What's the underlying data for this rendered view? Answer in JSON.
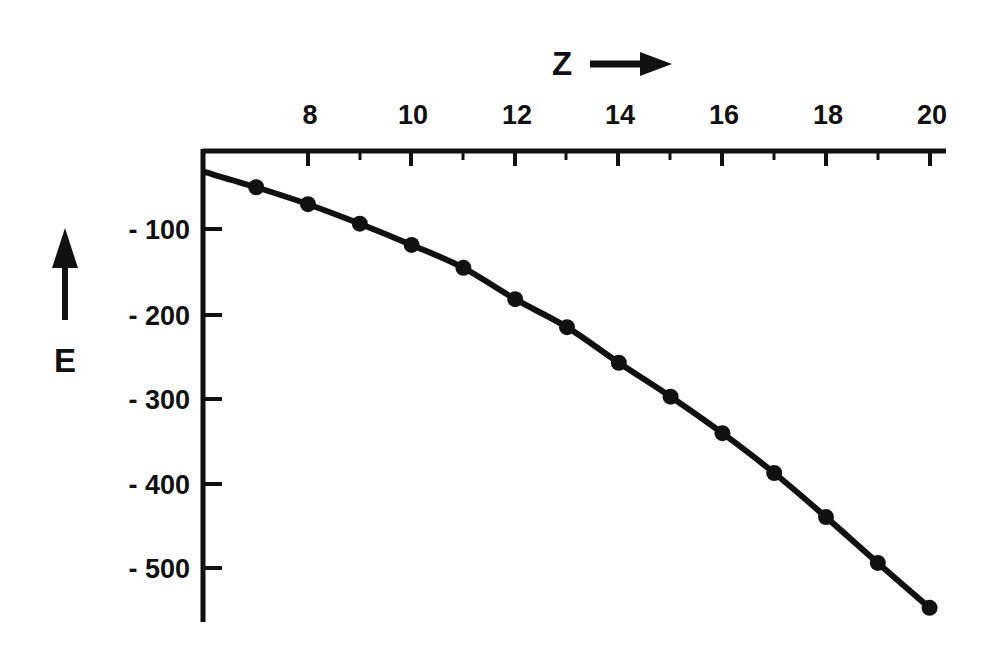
{
  "figure": {
    "background_color": "#ffffff",
    "ink_color": "#111111"
  },
  "axes": {
    "x": {
      "title": "Z",
      "title_arrow": "⟶",
      "position": "top",
      "tick_labels": [
        "8",
        "10",
        "12",
        "14",
        "16",
        "18",
        "20"
      ],
      "tick_values": [
        8,
        10,
        12,
        14,
        16,
        18,
        20
      ],
      "range": [
        6,
        20.5
      ],
      "minor_ticks": true
    },
    "y": {
      "title": "E",
      "title_arrow": "↑",
      "position": "left",
      "tick_labels": [
        "- 100",
        "- 200",
        "- 300",
        "- 400",
        "- 500"
      ],
      "tick_values": [
        -100,
        -200,
        -300,
        -400,
        -500
      ],
      "range": [
        -580,
        0
      ]
    }
  },
  "chart_data": {
    "type": "line",
    "title": "",
    "subtitle": "",
    "xlabel": "Z",
    "ylabel": "E",
    "xlim": [
      6,
      20.5
    ],
    "ylim": [
      -580,
      0
    ],
    "grid": false,
    "legend": null,
    "marker": "filled-circle",
    "series": [
      {
        "name": "E(Z)",
        "x": [
          6,
          7,
          8,
          9,
          10,
          11,
          12,
          13,
          14,
          15,
          16,
          17,
          18,
          19,
          20
        ],
        "y": [
          -33,
          -51,
          -71,
          -94,
          -119,
          -146,
          -183,
          -216,
          -258,
          -298,
          -341,
          -388,
          -440,
          -494,
          -547
        ],
        "markers_shown_at_x": [
          7,
          8,
          9,
          10,
          11,
          12,
          13,
          14,
          15,
          16,
          17,
          18,
          19,
          20
        ]
      }
    ]
  },
  "annotations": {
    "x_axis_title_full": "Z ⟶",
    "y_axis_title_full": "E"
  }
}
